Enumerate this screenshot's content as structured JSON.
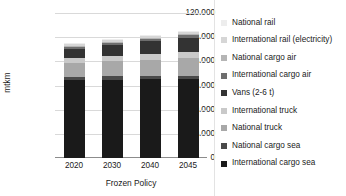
{
  "chart_data": {
    "type": "bar",
    "stacked": true,
    "title": "",
    "xlabel": "Frozen Policy",
    "ylabel": "mtkm",
    "categories": [
      "2020",
      "2030",
      "2040",
      "2045"
    ],
    "ylim": [
      0,
      120000
    ],
    "yticks": [
      0,
      20000,
      40000,
      60000,
      80000,
      100000,
      120000
    ],
    "ytick_labels": [
      "0",
      "20.000",
      "40.000",
      "60.000",
      "80.000",
      "100.000",
      "120.000"
    ],
    "grid": true,
    "legend_position": "right",
    "series": [
      {
        "name": "International cargo sea",
        "color": "#1a1a1a",
        "values": [
          64500,
          64800,
          65000,
          65200
        ]
      },
      {
        "name": "National cargo sea",
        "color": "#4a4a4a",
        "values": [
          2600,
          2700,
          2800,
          2900
        ]
      },
      {
        "name": "National truck",
        "color": "#a8a8a8",
        "values": [
          11500,
          12500,
          13500,
          14500
        ]
      },
      {
        "name": "International truck",
        "color": "#c9c9c9",
        "values": [
          4200,
          4600,
          5000,
          5400
        ]
      },
      {
        "name": "Vans (2-6 t)",
        "color": "#333333",
        "values": [
          7800,
          9000,
          10300,
          11500
        ]
      },
      {
        "name": "International cargo air",
        "color": "#6e6e6e",
        "values": [
          1600,
          1800,
          2000,
          2200
        ]
      },
      {
        "name": "National cargo air",
        "color": "#b5b5b5",
        "values": [
          900,
          1000,
          1100,
          1200
        ]
      },
      {
        "name": "International rail (electricity)",
        "color": "#d6d6d6",
        "values": [
          1100,
          1200,
          1300,
          1400
        ]
      },
      {
        "name": "National rail",
        "color": "#ededed",
        "values": [
          800,
          900,
          1000,
          1100
        ]
      }
    ],
    "totals": [
      95000,
      98500,
      102000,
      105400
    ]
  },
  "legend": {
    "items": [
      {
        "label": "National rail",
        "color": "#ededed"
      },
      {
        "label": "International rail (electricity)",
        "color": "#d6d6d6"
      },
      {
        "label": "National cargo air",
        "color": "#b5b5b5"
      },
      {
        "label": "International cargo air",
        "color": "#6e6e6e"
      },
      {
        "label": "Vans (2-6 t)",
        "color": "#333333"
      },
      {
        "label": "International truck",
        "color": "#c9c9c9"
      },
      {
        "label": "National truck",
        "color": "#a8a8a8"
      },
      {
        "label": "National cargo sea",
        "color": "#4a4a4a"
      },
      {
        "label": "International cargo sea",
        "color": "#1a1a1a"
      }
    ]
  }
}
